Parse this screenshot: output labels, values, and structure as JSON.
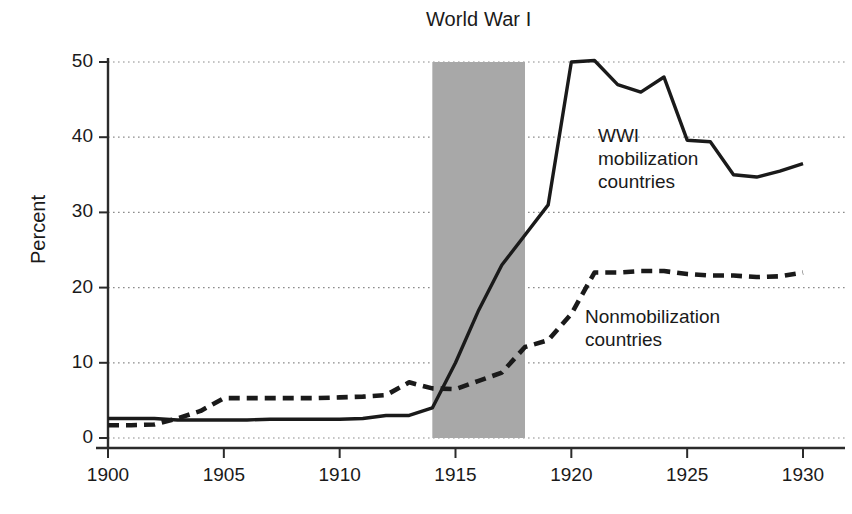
{
  "chart_data": {
    "type": "line",
    "title": "",
    "xlabel": "",
    "ylabel": "Percent",
    "xlim": [
      1900,
      1930
    ],
    "ylim": [
      0,
      50
    ],
    "grid": "horizontal-dotted",
    "legend_position": "inline-annotation",
    "x_ticks": [
      "1900",
      "1905",
      "1910",
      "1915",
      "1920",
      "1925",
      "1930"
    ],
    "y_ticks": [
      "0",
      "10",
      "20",
      "30",
      "40",
      "50"
    ],
    "x": [
      1900,
      1901,
      1902,
      1903,
      1904,
      1905,
      1906,
      1907,
      1908,
      1909,
      1910,
      1911,
      1912,
      1913,
      1914,
      1915,
      1916,
      1917,
      1918,
      1919,
      1920,
      1921,
      1922,
      1923,
      1924,
      1925,
      1926,
      1927,
      1928,
      1929,
      1930
    ],
    "series": [
      {
        "name": "WWI mobilization countries",
        "style": "solid",
        "color": "#1a1a1a",
        "values": [
          2.6,
          2.6,
          2.6,
          2.4,
          2.4,
          2.4,
          2.4,
          2.5,
          2.5,
          2.5,
          2.5,
          2.6,
          3.0,
          3.0,
          4.0,
          10.0,
          17.0,
          23.0,
          27.0,
          31.0,
          50.0,
          50.2,
          47.0,
          46.0,
          48.0,
          39.6,
          39.4,
          35.0,
          34.7,
          35.5,
          36.5
        ]
      },
      {
        "name": "Nonmobilization countries",
        "style": "dashed",
        "color": "#1a1a1a",
        "values": [
          1.7,
          1.7,
          1.8,
          2.6,
          3.6,
          5.3,
          5.3,
          5.3,
          5.3,
          5.3,
          5.4,
          5.5,
          5.7,
          7.4,
          6.6,
          6.5,
          7.6,
          8.7,
          12.1,
          13.0,
          16.5,
          22.0,
          22.0,
          22.2,
          22.2,
          21.8,
          21.6,
          21.6,
          21.4,
          21.5,
          22.0
        ]
      }
    ],
    "annotations": [
      {
        "name": "World War I",
        "type": "shaded-band",
        "x_start": 1914,
        "x_end": 1918,
        "label": "World War I",
        "fill": "#a8a8a8"
      }
    ],
    "series_labels": {
      "wwi": [
        "WWI",
        "mobilization",
        "countries"
      ],
      "nonmobilization": [
        "Nonmobilization",
        "countries"
      ]
    },
    "colors": {
      "ink": "#1a1a1a",
      "gridline": "#8c8c8c",
      "band_fill": "#a8a8a8",
      "background": "#ffffff"
    }
  },
  "axes": {
    "y_title": "Percent",
    "y_tick_labels": [
      "50",
      "40",
      "30",
      "20",
      "10",
      "0"
    ],
    "x_tick_labels": [
      "1900",
      "1905",
      "1910",
      "1915",
      "1920",
      "1925",
      "1930"
    ]
  },
  "band": {
    "title": "World War I"
  },
  "labels": {
    "wwi_line1": "WWI",
    "wwi_line2": "mobilization",
    "wwi_line3": "countries",
    "nonmob_line1": "Nonmobilization",
    "nonmob_line2": "countries"
  }
}
